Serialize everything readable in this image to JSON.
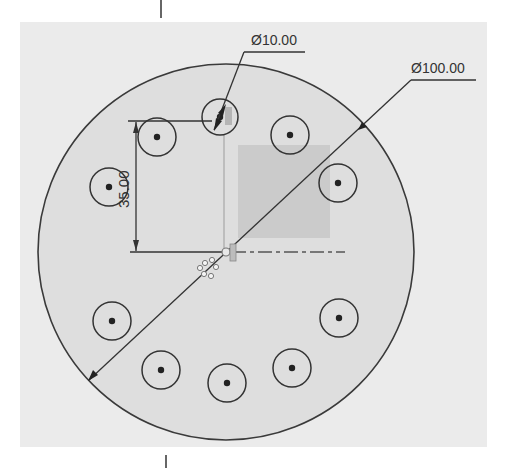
{
  "viewport": {
    "title": "Sketch view - bolt circle plate",
    "background": "#ffffff",
    "panel_color": "#ebebeb",
    "sketch_fill": "#dddddd",
    "line_color": "#333333",
    "highlight_fill": "#cfcfcf"
  },
  "sketch": {
    "outer_circle": {
      "cx": 226,
      "cy": 252,
      "r": 188,
      "label": "outer-profile"
    },
    "holes": [
      {
        "cx": 220,
        "cy": 117,
        "r": 18,
        "selected": true
      },
      {
        "cx": 157,
        "cy": 137,
        "r": 19
      },
      {
        "cx": 290,
        "cy": 135,
        "r": 19
      },
      {
        "cx": 109,
        "cy": 187,
        "r": 19
      },
      {
        "cx": 338,
        "cy": 183,
        "r": 19
      },
      {
        "cx": 112,
        "cy": 321,
        "r": 19
      },
      {
        "cx": 339,
        "cy": 318,
        "r": 19
      },
      {
        "cx": 161,
        "cy": 370,
        "r": 19
      },
      {
        "cx": 227,
        "cy": 383,
        "r": 19
      },
      {
        "cx": 292,
        "cy": 368,
        "r": 19
      }
    ],
    "origin": {
      "x": 226,
      "y": 252
    },
    "shaded_region": {
      "x": 238,
      "y": 145,
      "w": 92,
      "h": 93
    }
  },
  "dimensions": {
    "outer_diameter": {
      "label": "Ø100.00",
      "value": 100.0
    },
    "hole_diameter": {
      "label": "Ø10.00",
      "value": 10.0
    },
    "hole_offset": {
      "label": "35.00",
      "value": 35.0
    }
  }
}
